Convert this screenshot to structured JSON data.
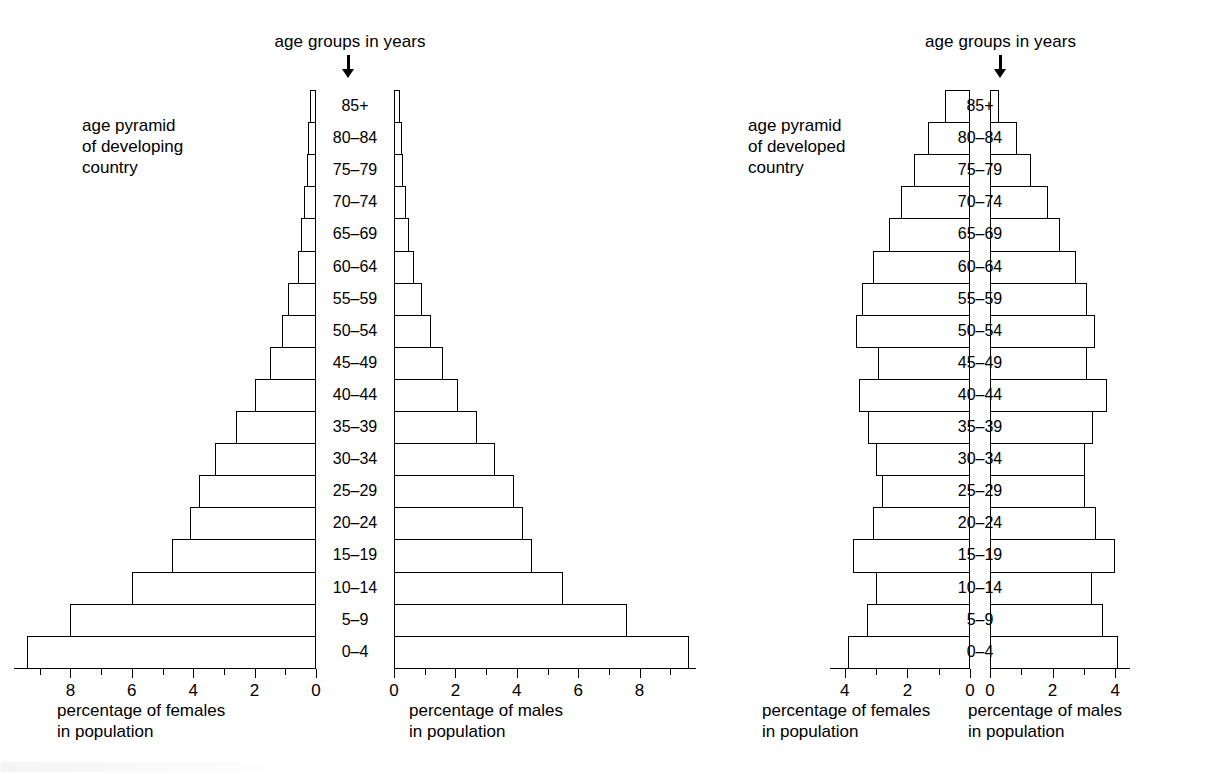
{
  "figure": {
    "background_color": "#ffffff",
    "line_color": "#000000"
  },
  "panels": [
    {
      "id": "developing",
      "header": "age groups in years",
      "caption": "age pyramid\nof developing\ncountry",
      "female_axis_caption": "percentage of females\nin population",
      "male_axis_caption": "percentage of males\nin population",
      "female_ticks": [
        "8",
        "6",
        "4",
        "2",
        "0"
      ],
      "male_ticks": [
        "0",
        "2",
        "4",
        "6",
        "8"
      ]
    },
    {
      "id": "developed",
      "header": "age groups in years",
      "caption": "age pyramid\nof developed\ncountry",
      "female_axis_caption": "percentage of females\nin population",
      "male_axis_caption": "percentage of males\nin population",
      "female_ticks": [
        "4",
        "2",
        "0"
      ],
      "male_ticks": [
        "0",
        "2",
        "4"
      ]
    }
  ],
  "age_groups": [
    "85+",
    "80–84",
    "75–79",
    "70–74",
    "65–69",
    "60–64",
    "55–59",
    "50–54",
    "45–49",
    "40–44",
    "35–39",
    "30–34",
    "25–29",
    "20–24",
    "15–19",
    "10–14",
    "5–9",
    "0–4"
  ],
  "chart_data": [
    {
      "type": "bar",
      "title": "age pyramid of developing country",
      "subtitle": "age groups in years",
      "orientation": "population-pyramid",
      "categories": [
        "85+",
        "80–84",
        "75–79",
        "70–74",
        "65–69",
        "60–64",
        "55–59",
        "50–54",
        "45–49",
        "40–44",
        "35–39",
        "30–34",
        "25–29",
        "20–24",
        "15–19",
        "10–14",
        "5–9",
        "0–4"
      ],
      "series": [
        {
          "name": "percentage of females in population",
          "side": "left",
          "values": [
            0.2,
            0.25,
            0.3,
            0.4,
            0.5,
            0.6,
            0.9,
            1.1,
            1.5,
            2.0,
            2.6,
            3.3,
            3.8,
            4.1,
            4.7,
            6.0,
            8.0,
            9.4
          ]
        },
        {
          "name": "percentage of males in population",
          "side": "right",
          "values": [
            0.2,
            0.25,
            0.3,
            0.4,
            0.5,
            0.65,
            0.9,
            1.2,
            1.6,
            2.1,
            2.7,
            3.3,
            3.9,
            4.2,
            4.5,
            5.5,
            7.6,
            9.6
          ]
        }
      ],
      "xlabel_left": "percentage of females in population",
      "xlabel_right": "percentage of males in population",
      "ylabel": "age groups in years",
      "xlim_left": [
        0,
        9.8
      ],
      "xlim_right": [
        0,
        9.8
      ],
      "xticks_left": [
        8,
        6,
        4,
        2,
        0
      ],
      "xticks_right": [
        0,
        2,
        4,
        6,
        8
      ],
      "grid": false,
      "legend": "none"
    },
    {
      "type": "bar",
      "title": "age pyramid of developed country",
      "subtitle": "age groups in years",
      "orientation": "population-pyramid",
      "categories": [
        "85+",
        "80–84",
        "75–79",
        "70–74",
        "65–69",
        "60–64",
        "55–59",
        "50–54",
        "45–49",
        "40–44",
        "35–39",
        "30–34",
        "25–29",
        "20–24",
        "15–19",
        "10–14",
        "5–9",
        "0–4"
      ],
      "series": [
        {
          "name": "percentage of females in population",
          "side": "left",
          "values": [
            0.8,
            1.35,
            1.8,
            2.2,
            2.6,
            3.1,
            3.45,
            3.65,
            2.95,
            3.55,
            3.25,
            3.0,
            2.8,
            3.1,
            3.75,
            3.0,
            3.3,
            3.9
          ]
        },
        {
          "name": "percentage of males in population",
          "side": "right",
          "values": [
            0.3,
            0.85,
            1.3,
            1.85,
            2.25,
            2.75,
            3.1,
            3.35,
            3.1,
            3.75,
            3.3,
            3.05,
            3.05,
            3.4,
            4.0,
            3.25,
            3.6,
            4.1
          ]
        }
      ],
      "xlabel_left": "percentage of females in population",
      "xlabel_right": "percentage of males in population",
      "ylabel": "age groups in years",
      "xlim_left": [
        0,
        4.4
      ],
      "xlim_right": [
        0,
        4.4
      ],
      "xticks_left": [
        4,
        2,
        0
      ],
      "xticks_right": [
        0,
        2,
        4
      ],
      "grid": false,
      "legend": "none"
    }
  ]
}
